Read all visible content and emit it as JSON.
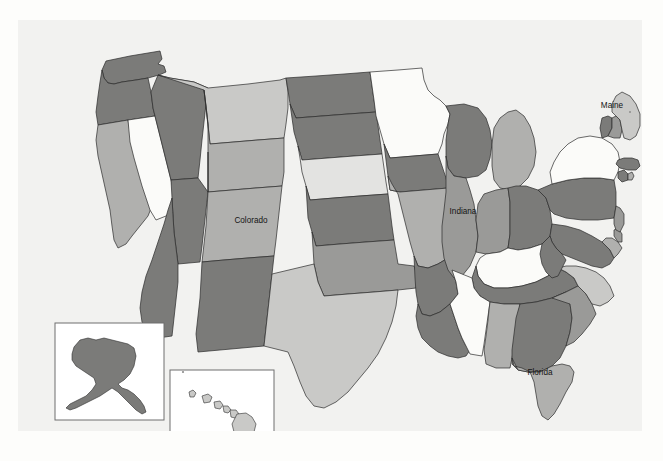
{
  "figure": {
    "background_color": "#f2f2f0",
    "page_color": "#fdfdfb",
    "border_color": "#2b2b2b"
  },
  "palette": {
    "level_1_lightest": "#fbfbf9",
    "level_2_light": "#e3e3e1",
    "level_3_medium_light": "#c9c9c7",
    "level_4_medium": "#b0b0ae",
    "level_5_medium_dark": "#9a9a98",
    "level_6_dark": "#7b7b79",
    "level_7_darkest": "#6b6b69"
  },
  "labels": [
    {
      "name": "Colorado",
      "x": 233,
      "y": 201
    },
    {
      "name": "Indiana",
      "x": 445,
      "y": 192
    },
    {
      "name": "Maine",
      "x": 594,
      "y": 86
    },
    {
      "name": "Florida",
      "x": 522,
      "y": 353
    }
  ],
  "insets": [
    {
      "name": "alaska-inset",
      "label": "Alaska",
      "fill": "level_6_dark",
      "x": 37,
      "y": 303,
      "width": 109,
      "height": 97
    },
    {
      "name": "hawaii-inset",
      "label": "Hawaii",
      "fill": "level_3_medium_light",
      "x": 152,
      "y": 350,
      "width": 104,
      "height": 86
    }
  ],
  "chart_data": {
    "type": "map",
    "subtitle": "",
    "projection": "albers-usa",
    "legend": "none",
    "value_encoding": "grayscale-shade",
    "states": [
      {
        "state": "Washington",
        "abbr": "WA",
        "shade": "level_6_dark"
      },
      {
        "state": "Oregon",
        "abbr": "OR",
        "shade": "level_6_dark"
      },
      {
        "state": "California",
        "abbr": "CA",
        "shade": "level_4_medium"
      },
      {
        "state": "Nevada",
        "abbr": "NV",
        "shade": "level_1_lightest"
      },
      {
        "state": "Idaho",
        "abbr": "ID",
        "shade": "level_6_dark"
      },
      {
        "state": "Montana",
        "abbr": "MT",
        "shade": "level_3_medium_light"
      },
      {
        "state": "Wyoming",
        "abbr": "WY",
        "shade": "level_4_medium"
      },
      {
        "state": "Utah",
        "abbr": "UT",
        "shade": "level_6_dark"
      },
      {
        "state": "Colorado",
        "abbr": "CO",
        "shade": "level_4_medium"
      },
      {
        "state": "Arizona",
        "abbr": "AZ",
        "shade": "level_6_dark"
      },
      {
        "state": "New Mexico",
        "abbr": "NM",
        "shade": "level_6_dark"
      },
      {
        "state": "North Dakota",
        "abbr": "ND",
        "shade": "level_6_dark"
      },
      {
        "state": "South Dakota",
        "abbr": "SD",
        "shade": "level_6_dark"
      },
      {
        "state": "Nebraska",
        "abbr": "NE",
        "shade": "level_2_light"
      },
      {
        "state": "Kansas",
        "abbr": "KS",
        "shade": "level_6_dark"
      },
      {
        "state": "Oklahoma",
        "abbr": "OK",
        "shade": "level_5_medium_dark"
      },
      {
        "state": "Texas",
        "abbr": "TX",
        "shade": "level_3_medium_light"
      },
      {
        "state": "Minnesota",
        "abbr": "MN",
        "shade": "level_1_lightest"
      },
      {
        "state": "Iowa",
        "abbr": "IA",
        "shade": "level_6_dark"
      },
      {
        "state": "Missouri",
        "abbr": "MO",
        "shade": "level_4_medium"
      },
      {
        "state": "Arkansas",
        "abbr": "AR",
        "shade": "level_6_dark"
      },
      {
        "state": "Louisiana",
        "abbr": "LA",
        "shade": "level_6_dark"
      },
      {
        "state": "Wisconsin",
        "abbr": "WI",
        "shade": "level_6_dark"
      },
      {
        "state": "Illinois",
        "abbr": "IL",
        "shade": "level_5_medium_dark"
      },
      {
        "state": "Michigan",
        "abbr": "MI",
        "shade": "level_4_medium"
      },
      {
        "state": "Indiana",
        "abbr": "IN",
        "shade": "level_5_medium_dark"
      },
      {
        "state": "Ohio",
        "abbr": "OH",
        "shade": "level_6_dark"
      },
      {
        "state": "Kentucky",
        "abbr": "KY",
        "shade": "level_1_lightest"
      },
      {
        "state": "Tennessee",
        "abbr": "TN",
        "shade": "level_6_dark"
      },
      {
        "state": "Mississippi",
        "abbr": "MS",
        "shade": "level_1_lightest"
      },
      {
        "state": "Alabama",
        "abbr": "AL",
        "shade": "level_4_medium"
      },
      {
        "state": "Georgia",
        "abbr": "GA",
        "shade": "level_6_dark"
      },
      {
        "state": "Florida",
        "abbr": "FL",
        "shade": "level_4_medium"
      },
      {
        "state": "South Carolina",
        "abbr": "SC",
        "shade": "level_5_medium_dark"
      },
      {
        "state": "North Carolina",
        "abbr": "NC",
        "shade": "level_3_medium_light"
      },
      {
        "state": "Virginia",
        "abbr": "VA",
        "shade": "level_6_dark"
      },
      {
        "state": "West Virginia",
        "abbr": "WV",
        "shade": "level_6_dark"
      },
      {
        "state": "Maryland",
        "abbr": "MD",
        "shade": "level_4_medium"
      },
      {
        "state": "Delaware",
        "abbr": "DE",
        "shade": "level_5_medium_dark"
      },
      {
        "state": "Pennsylvania",
        "abbr": "PA",
        "shade": "level_6_dark"
      },
      {
        "state": "New Jersey",
        "abbr": "NJ",
        "shade": "level_5_medium_dark"
      },
      {
        "state": "New York",
        "abbr": "NY",
        "shade": "level_1_lightest"
      },
      {
        "state": "Connecticut",
        "abbr": "CT",
        "shade": "level_6_dark"
      },
      {
        "state": "Rhode Island",
        "abbr": "RI",
        "shade": "level_4_medium"
      },
      {
        "state": "Massachusetts",
        "abbr": "MA",
        "shade": "level_6_dark"
      },
      {
        "state": "Vermont",
        "abbr": "VT",
        "shade": "level_6_dark"
      },
      {
        "state": "New Hampshire",
        "abbr": "NH",
        "shade": "level_5_medium_dark"
      },
      {
        "state": "Maine",
        "abbr": "ME",
        "shade": "level_3_medium_light"
      },
      {
        "state": "Alaska",
        "abbr": "AK",
        "shade": "level_6_dark"
      },
      {
        "state": "Hawaii",
        "abbr": "HI",
        "shade": "level_3_medium_light"
      }
    ]
  },
  "geometry": {
    "WA": "88,41 112,36 130,33 142,31 144,39 140,44 146,46 148,52 141,55 130,58 118,60 104,62 96,64 90,63 86,58 84,50",
    "OR": "84,50 86,58 90,63 96,64 104,62 118,60 130,58 133,72 135,88 137,96 110,100 92,103 80,105 78,92 80,76 82,62",
    "CA": "80,105 92,103 110,100 112,112 116,126 120,140 124,152 128,164 132,176 134,186 130,196 122,206 114,216 108,224 100,228 96,220 94,206 92,190 88,172 84,154 80,136 78,120",
    "NV": "110,100 137,96 141,112 145,128 149,144 153,160 157,176 160,190 148,196 138,200 132,190 128,178 124,166 120,152 116,138 112,122",
    "ID": "133,72 135,88 137,96 141,112 145,128 149,144 153,160 180,158 182,140 184,120 186,102 188,84 190,68 176,62 164,60 152,58 140,55",
    "MT": "140,55 152,58 164,60 176,62 190,68 230,64 262,60 268,58 270,72 270,88 268,104 266,118 240,120 216,122 192,124 190,104 188,86 186,70",
    "WY": "190,104 188,86 186,70 192,124 216,122 240,120 266,118 266,136 266,152 264,166 238,168 214,170 190,172 190,152 190,132",
    "UT": "153,160 180,158 190,172 190,152 190,132 190,172 188,190 186,208 184,226 182,242 160,244 158,228 156,212 155,196 154,178",
    "CO": "190,172 214,170 238,168 264,166 262,184 260,202 258,220 256,236 230,238 206,240 184,242 186,224 188,206 189,189",
    "AZ": "154,178 155,196 156,212 158,228 160,244 160,262 158,280 156,298 154,316 140,318 130,312 124,302 122,288 124,272 128,256 134,240 140,222 146,204 150,190",
    "NM": "184,242 206,240 230,238 256,236 254,254 252,272 250,290 248,308 246,326 224,328 202,330 180,332 178,314 180,296 182,278 183,260",
    "ND": "268,58 298,56 326,54 352,52 354,66 356,80 358,92 330,94 304,96 278,98 272,84 270,70",
    "SD": "272,84 278,98 304,96 330,94 358,92 360,106 362,120 364,134 336,136 310,138 284,140 280,126 276,112 274,98",
    "NE": "280,126 284,140 310,138 336,136 364,134 366,148 368,162 370,174 342,176 316,178 292,180 288,166 284,152 282,138",
    "KS": "288,166 292,180 316,178 342,176 370,174 372,190 374,206 376,220 348,222 322,224 298,226 294,212 290,198 289,182",
    "OK": "294,212 298,226 322,224 348,222 376,220 378,232 380,244 396,246 400,258 398,268 380,270 356,272 330,274 306,276 300,262 296,244 295,228",
    "TX": "246,326 248,308 250,290 252,272 254,254 296,244 300,262 306,276 330,274 356,272 380,270 378,286 374,302 368,318 360,334 350,348 340,360 330,372 318,382 306,388 296,386 288,376 282,362 276,346 270,332 262,330 254,328",
    "MN": "352,52 380,50 404,48 406,60 410,70 416,76 422,80 428,86 432,94 430,104 426,114 424,124 420,134 396,136 372,138 366,124 362,110 358,96 356,80 354,66",
    "IA": "366,124 372,138 396,136 420,134 424,146 428,158 430,168 406,170 382,172 372,170 370,156 368,140",
    "MO": "370,156 372,170 382,172 406,170 430,168 434,180 438,192 442,204 440,216 436,228 430,238 420,244 410,248 400,246 396,236 392,222 388,206 384,190 380,174 374,164",
    "AR": "396,236 400,246 410,248 420,244 430,238 434,250 438,262 440,274 432,284 422,292 412,296 404,294 400,284 398,272 397,258",
    "LA": "400,284 404,294 412,296 422,292 432,284 436,296 440,308 444,318 448,326 452,330 448,336 440,338 430,336 420,332 412,326 404,318 400,308 398,296",
    "WI": "430,104 432,94 428,86 446,84 460,88 468,98 472,110 474,124 472,138 468,150 460,156 448,158 436,156 430,148 428,136 428,120",
    "IL": "428,136 430,148 436,156 448,158 452,170 456,184 458,200 460,216 458,232 452,246 444,256 436,258 430,250 426,238 424,222 424,206 426,190 428,172 428,154",
    "MI": "474,124 476,108 482,98 490,92 498,90 506,96 512,106 516,118 518,132 516,146 510,158 502,166 492,170 482,168 476,160 474,146 474,134",
    "IN": "458,200 460,216 458,232 468,234 482,232 490,228 492,214 492,198 492,182 490,168 478,170 466,174 460,184",
    "OH": "490,168 492,182 492,198 492,214 490,228 500,230 512,228 524,224 532,216 534,204 532,190 528,178 520,170 508,166 498,166",
    "KY": "468,234 482,232 490,228 500,230 512,228 524,224 530,232 536,240 540,248 530,256 518,262 504,266 490,268 476,268 466,264 460,256 458,246 462,238",
    "TN": "458,246 460,256 466,264 476,268 490,268 504,266 518,262 530,256 540,248 548,252 556,258 560,266 548,272 534,278 518,282 502,284 486,284 472,282 462,276 456,268 454,258",
    "MS": "440,274 438,262 434,250 454,258 456,268 462,276 472,282 470,296 468,310 466,324 464,336 452,334 448,326 444,318 440,308 436,296 432,284",
    "AL": "472,282 486,284 502,284 500,298 498,312 496,326 494,338 492,348 478,348 468,344 466,330 468,316 470,300 471,290",
    "GA": "502,284 518,282 534,278 548,272 552,284 554,298 552,312 548,326 542,338 534,346 522,352 510,352 500,350 494,344 494,330 496,314 498,298",
    "FL": "494,338 500,350 510,352 522,352 534,346 544,344 552,346 556,352 554,362 548,372 542,384 536,394 530,400 524,396 520,386 518,374 516,362 512,352 504,348 496,346",
    "SC": "534,278 548,272 560,266 568,274 574,284 578,294 572,304 564,314 556,322 548,326 552,312 554,298 552,284",
    "NC": "540,248 548,252 556,258 560,266 568,274 574,284 582,286 590,282 596,276 592,266 586,258 578,252 568,248 558,246 548,246",
    "VA": "532,216 534,204 548,206 562,210 574,216 584,222 592,230 596,238 592,244 584,248 574,246 564,242 554,238 544,234 538,228 534,222",
    "WV": "524,224 532,216 534,222 538,228 544,234 548,240 544,248 540,256 534,258 528,252 524,244 522,234",
    "MD": "584,222 592,230 596,238 600,234 604,228 600,222 594,218 588,218",
    "DE": "596,210 600,208 604,214 604,222 600,222 596,216",
    "PA": "532,190 528,178 520,170 534,164 550,160 566,158 582,158 596,160 598,172 598,186 596,198 580,200 564,200 548,198 536,194",
    "NJ": "596,198 598,186 602,188 606,194 606,204 602,212 598,210 596,204",
    "NY": "534,164 550,160 566,158 582,158 596,160 600,152 602,142 600,132 594,124 584,118 572,116 560,118 550,124 542,132 536,142 532,152",
    "CT": "600,152 606,150 610,154 610,160 604,162 600,158",
    "RI": "610,154 614,152 616,156 614,160 610,160",
    "MA": "600,140 606,138 614,138 620,140 622,146 618,150 610,150 602,148 598,144",
    "VT": "584,118 590,116 594,108 594,98 590,96 584,98 582,108",
    "NH": "594,98 594,108 590,116 596,118 602,118 604,110 602,100 598,96",
    "ME": "598,96 602,100 604,110 606,118 612,120 618,116 622,106 622,94 618,84 612,76 604,72 598,76 594,84 594,92",
    "AK": "56,327 62,320 70,318 78,320 86,318 94,320 102,322 110,324 116,328 118,336 116,346 112,354 106,360 100,364 104,368 110,370 116,374 122,380 126,386 128,392 124,394 118,390 112,384 106,378 100,372 94,368 88,372 82,376 74,380 66,384 58,388 52,390 48,388 52,384 60,380 68,376 74,370 78,364 76,358 70,354 64,350 58,346 54,340 54,334",
    "HI_1": "171,372 175,370 178,373 176,377 172,377",
    "HI_2": "184,376 190,374 194,377 192,382 186,383",
    "HI_3": "196,382 202,381 205,385 202,389 197,388",
    "HI_4": "205,386 210,386 213,390 210,393 206,392",
    "HI_5": "212,390 218,390 221,394 217,398 213,397",
    "HI_6": "219,394 228,393 234,397 238,404 236,412 230,418 222,418 216,412 214,404"
  }
}
